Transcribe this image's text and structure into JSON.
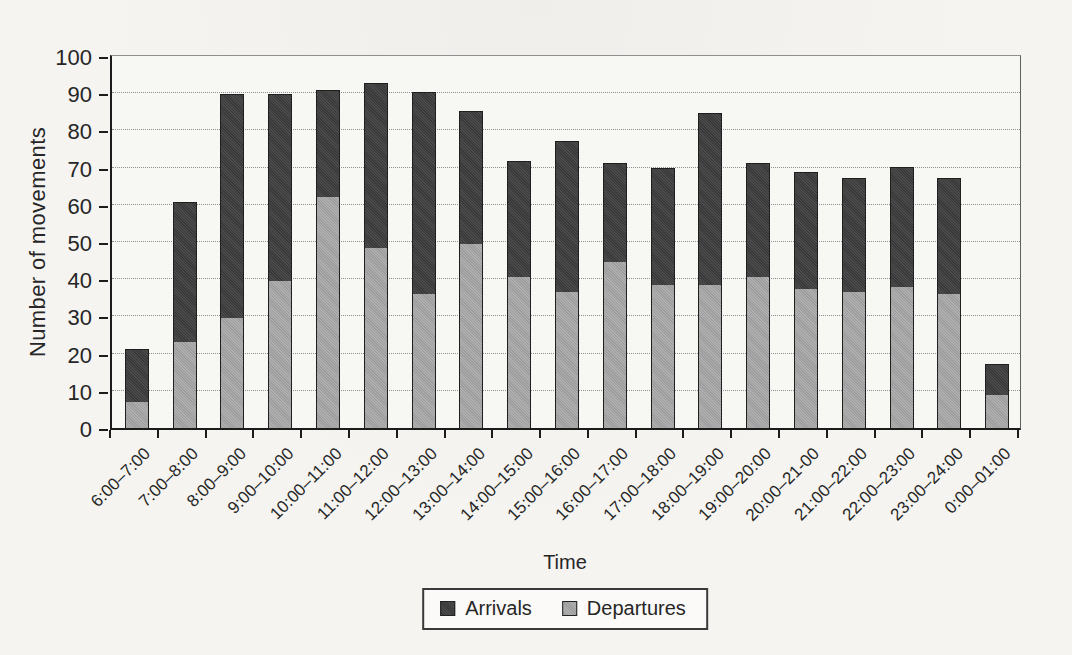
{
  "chart_data": {
    "type": "bar",
    "stacked": true,
    "title": "",
    "xlabel": "Time",
    "ylabel": "Number of movements",
    "categories": [
      "6:00–7:00",
      "7:00–8:00",
      "8:00–9:00",
      "9:00–10:00",
      "10:00–11:00",
      "11:00–12:00",
      "12:00–13:00",
      "13:00–14:00",
      "14:00–15:00",
      "15:00–16:00",
      "16:00–17:00",
      "17:00–18:00",
      "18:00–19:00",
      "19:00–20:00",
      "20:00–21-00",
      "21:00–22:00",
      "22:00–23:00",
      "23:00–24:00",
      "0:00–01:00"
    ],
    "series": [
      {
        "name": "Arrivals",
        "color": "#3d3d3d",
        "values": [
          14,
          37.5,
          60,
          50,
          28.5,
          44,
          54,
          35.5,
          31,
          40.5,
          26.5,
          31,
          46,
          30.5,
          31,
          30.5,
          32,
          31,
          8
        ]
      },
      {
        "name": "Departures",
        "color": "#a9a9a9",
        "values": [
          7,
          23,
          29.5,
          39.5,
          62,
          48.5,
          36,
          49.5,
          40.5,
          36.5,
          44.5,
          38.5,
          38.5,
          40.5,
          37.5,
          36.5,
          38,
          36,
          9
        ]
      }
    ],
    "stack_totals": [
      21,
      60.5,
      89.5,
      89.5,
      90.5,
      92.5,
      90,
      85,
      71.5,
      77,
      71,
      69.5,
      84.5,
      71,
      68.5,
      67,
      70,
      67,
      17
    ],
    "stack_order_bottom_to_top": [
      "Departures",
      "Arrivals"
    ],
    "ylim": [
      0,
      100
    ],
    "ytick_step": 10,
    "grid": "horizontal-dotted",
    "legend_position": "bottom-center"
  },
  "legend": {
    "items": [
      {
        "label": "Arrivals",
        "color": "#3d3d3d"
      },
      {
        "label": "Departures",
        "color": "#a9a9a9"
      }
    ]
  },
  "colors": {
    "paper": "#f5f4f1",
    "axis": "#1c1c1c",
    "gridline": "#909090",
    "text": "#262626"
  }
}
